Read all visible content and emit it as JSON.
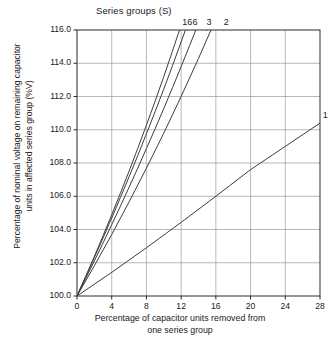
{
  "chart_data": {
    "type": "line",
    "title": "Series groups (S)",
    "xlabel_line1": "Percentage of capacitor units removed from",
    "xlabel_line2": "one series group",
    "ylabel_line1": "Percentage of nominal voltage on remaining capacitor",
    "ylabel_line2": "units in affected series group (%V)",
    "xlim": [
      0,
      28
    ],
    "ylim": [
      100.0,
      116.0
    ],
    "xticks": [
      0,
      4,
      8,
      12,
      16,
      20,
      24,
      28
    ],
    "yticks": [
      "100.0",
      "102.0",
      "104.0",
      "106.0",
      "108.0",
      "110.0",
      "112.0",
      "114.0",
      "116.0"
    ],
    "grid": true,
    "legend_position": "curve-end-labels-top",
    "axis_color": "#2a2a2a",
    "grid_color": "#9a9a9a",
    "curve_color": "#3c3c3c",
    "series": [
      {
        "name": "16",
        "label": "16",
        "x": [
          0,
          1,
          2,
          3,
          4,
          5,
          6,
          7,
          8,
          9,
          10,
          11,
          12,
          12.7
        ],
        "values": [
          100.0,
          101.18,
          102.38,
          103.62,
          104.88,
          106.18,
          107.51,
          108.88,
          110.28,
          111.72,
          113.2,
          114.73,
          116.3,
          116.0
        ]
      },
      {
        "name": "6",
        "label": "6",
        "x": [
          0,
          1,
          2,
          3,
          4,
          5,
          6,
          7,
          8,
          9,
          10,
          11,
          12,
          13,
          13.4
        ],
        "values": [
          100.0,
          101.15,
          102.31,
          103.49,
          104.69,
          105.92,
          107.17,
          108.45,
          109.76,
          111.09,
          112.45,
          113.85,
          115.28,
          116.75,
          116.0
        ]
      },
      {
        "name": "3",
        "label": "3",
        "x": [
          0,
          1,
          2,
          3,
          4,
          5,
          6,
          7,
          8,
          9,
          10,
          11,
          12,
          13,
          14,
          14.9
        ],
        "values": [
          100.0,
          101.05,
          102.11,
          103.19,
          104.29,
          105.4,
          106.54,
          107.69,
          108.87,
          110.06,
          111.28,
          112.53,
          113.8,
          115.09,
          116.41,
          116.0
        ]
      },
      {
        "name": "2",
        "label": "2",
        "x": [
          0,
          2,
          4,
          6,
          8,
          10,
          12,
          14,
          16,
          17,
          16.9
        ],
        "values": [
          100.0,
          101.82,
          103.7,
          105.66,
          107.69,
          109.8,
          112.0,
          114.29,
          116.67,
          117.9,
          116.0
        ]
      },
      {
        "name": "1",
        "label": "1",
        "x": [
          0,
          4,
          8,
          12,
          16,
          20,
          24,
          28
        ],
        "values": [
          100.0,
          101.42,
          102.9,
          104.43,
          106.0,
          107.6,
          109.0,
          110.4
        ]
      }
    ],
    "curve_end_labels": [
      {
        "text": "16",
        "x_data": 12.7
      },
      {
        "text": "6",
        "x_data": 13.6
      },
      {
        "text": "3",
        "x_data": 15.2
      },
      {
        "text": "2",
        "x_data": 17.2
      },
      {
        "text": "1",
        "x_data": 28.6
      }
    ]
  }
}
